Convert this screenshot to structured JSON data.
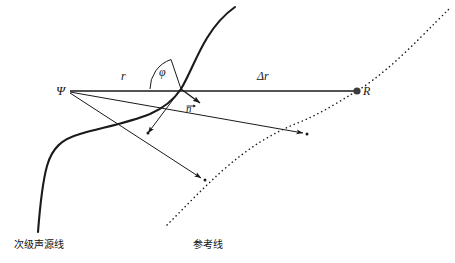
{
  "figure": {
    "width": 455,
    "height": 263,
    "background": "#ffffff",
    "stroke_color": "#1a1a1a",
    "labels": {
      "psi": "Ψ",
      "r": "r",
      "delta_r": "Δr",
      "phi": "φ",
      "receiver": "R",
      "normal_vector": "n",
      "secondary_source_line": "次级声源线",
      "reference_line": "参考线"
    },
    "points": {
      "psi": {
        "x": 68,
        "y": 91
      },
      "intersection": {
        "x": 181,
        "y": 89
      },
      "receiver": {
        "x": 357,
        "y": 91
      },
      "arrow_mid_right_tip": {
        "x": 307,
        "y": 134
      },
      "arrow_lower_tip": {
        "x": 205,
        "y": 180
      },
      "normal_tip": {
        "x": 203,
        "y": 104
      }
    },
    "elements": {
      "secondary_source_curve": "thick solid S-shaped curve",
      "reference_curve": "dotted curve",
      "main_ray": "Ψ to R horizontal line",
      "angle_arc": "φ arc at intersection"
    }
  }
}
